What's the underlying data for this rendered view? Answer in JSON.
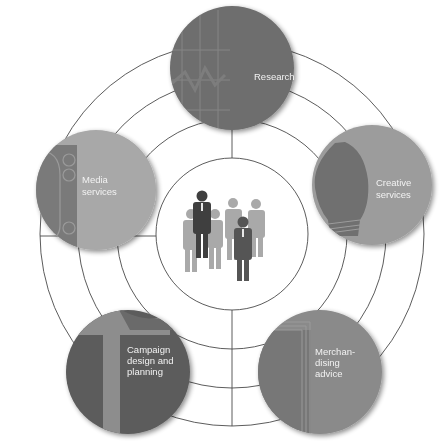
{
  "diagram": {
    "type": "hub-and-spoke",
    "center": {
      "label": "",
      "icon": "people-group-icon",
      "description": "Group of business people silhouettes"
    },
    "rings": 3,
    "nodes": [
      {
        "id": "research",
        "lines": [
          "Research"
        ],
        "icon": "chart-grid-icon",
        "fill": "#6e6e6e",
        "accent": "#5f5f5f"
      },
      {
        "id": "creative-services",
        "lines": [
          "Creative",
          "services"
        ],
        "icon": "light-bulb-icon",
        "fill": "#9c9c9c",
        "accent": "#6f6f6f"
      },
      {
        "id": "merchandising-advice",
        "lines": [
          "Merchan-",
          "dising",
          "advice"
        ],
        "icon": "catalog-pages-icon",
        "fill": "#8a8a8a",
        "accent": "#777777"
      },
      {
        "id": "campaign-design-and-planning",
        "lines": [
          "Campaign",
          "design and",
          "planning"
        ],
        "icon": "document-stripe-icon",
        "fill": "#5c5c5c",
        "accent": "#8d8d8d"
      },
      {
        "id": "media-services",
        "lines": [
          "Media",
          "services"
        ],
        "icon": "media-panel-icon",
        "fill": "#a8a8a8",
        "accent": "#7a7a7a"
      }
    ],
    "colors": {
      "line": "#4a4a4a",
      "background": "#ffffff",
      "label": "#f2f2f2"
    }
  }
}
